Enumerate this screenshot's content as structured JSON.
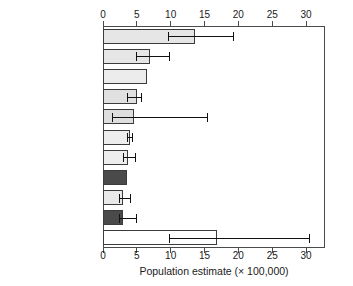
{
  "chart_data": {
    "type": "bar",
    "orientation": "horizontal",
    "title": "",
    "xlabel": "Population estimate (× 100,000)",
    "ylabel": "",
    "xlim": [
      0,
      32.8
    ],
    "xticks": [
      0,
      5,
      10,
      15,
      20,
      25,
      30
    ],
    "xtick_labels": [
      "0",
      "5",
      "10",
      "15",
      "20",
      "25",
      "30"
    ],
    "axis_top": true,
    "axis_bottom": true,
    "grid": false,
    "legend": "none",
    "categories": [
      "POLAND",
      "ROMANIA",
      "UNITED KINGDOM",
      "SPAIN",
      "DENMARK",
      "BELARUS",
      "LATVIA",
      "UKRAINE",
      "FINLAND",
      "GERMANY",
      "Other countries"
    ],
    "values": [
      13.6,
      6.9,
      6.5,
      5.0,
      4.6,
      4.0,
      3.7,
      3.5,
      3.0,
      3.0,
      16.9
    ],
    "error_low": [
      9.6,
      4.9,
      null,
      3.6,
      1.3,
      3.6,
      3.0,
      null,
      2.4,
      2.4,
      9.7
    ],
    "error_high": [
      19.2,
      9.8,
      null,
      5.6,
      15.3,
      4.3,
      4.8,
      null,
      4.0,
      4.9,
      30.5
    ],
    "bar_colors": [
      "#e6e6e6",
      "#e6e6e6",
      "#ececec",
      "#e0e0e0",
      "#dedede",
      "#ededed",
      "#ededed",
      "#4a4a4a",
      "#e9e9e9",
      "#4a4a4a",
      "#ffffff"
    ],
    "bar_edge_color": "#3b3b3b",
    "error_color": "#111111",
    "highlight_color": "#4a4a4a"
  }
}
